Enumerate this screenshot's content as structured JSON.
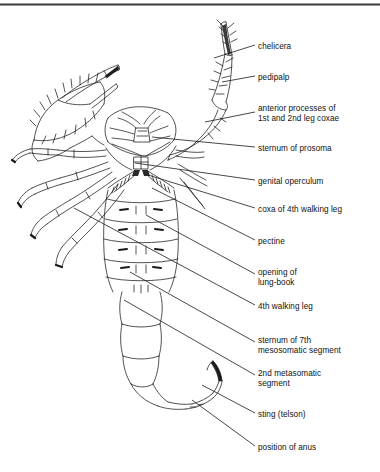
{
  "figure": {
    "background_color": "#ffffff",
    "ink_color": "#1a1a1a",
    "top_border_color": "#3a3a3a"
  },
  "labels": [
    {
      "id": "chelicera",
      "text": "chelicera",
      "x": 258,
      "y": 42,
      "leader": [
        255,
        45,
        214,
        58
      ]
    },
    {
      "id": "pedipalp",
      "text": "pedipalp",
      "x": 258,
      "y": 73,
      "leader": [
        255,
        76,
        222,
        82
      ]
    },
    {
      "id": "anterior-coxae-1",
      "text": "anterior processes of",
      "x": 258,
      "y": 104,
      "leader": [
        255,
        112,
        205,
        122
      ]
    },
    {
      "id": "anterior-coxae-2",
      "text": "1st and 2nd leg coxae",
      "x": 258,
      "y": 114,
      "leader": null
    },
    {
      "id": "sternum-prosoma",
      "text": "sternum of prosoma",
      "x": 258,
      "y": 144,
      "leader": [
        255,
        147,
        152,
        137
      ]
    },
    {
      "id": "genital-operculum",
      "text": "genital operculum",
      "x": 258,
      "y": 177,
      "leader": [
        255,
        180,
        135,
        163
      ]
    },
    {
      "id": "coxa-4th-leg",
      "text": "coxa of 4th walking leg",
      "x": 258,
      "y": 205,
      "leader": [
        255,
        208,
        148,
        175
      ]
    },
    {
      "id": "pectine",
      "text": "pectine",
      "x": 258,
      "y": 237,
      "leader": [
        255,
        240,
        152,
        188
      ]
    },
    {
      "id": "lung-book-1",
      "text": "opening of",
      "x": 258,
      "y": 268,
      "leader": [
        255,
        274,
        146,
        215
      ]
    },
    {
      "id": "lung-book-2",
      "text": "lung-book",
      "x": 258,
      "y": 278,
      "leader": null
    },
    {
      "id": "4th-walking-leg",
      "text": "4th walking leg",
      "x": 258,
      "y": 302,
      "leader": [
        255,
        305,
        74,
        208
      ]
    },
    {
      "id": "sternum-7th-1",
      "text": "sternum of 7th",
      "x": 258,
      "y": 336,
      "leader": [
        255,
        342,
        130,
        272
      ]
    },
    {
      "id": "sternum-7th-2",
      "text": "mesosomatic segment",
      "x": 258,
      "y": 346,
      "leader": null
    },
    {
      "id": "metasomatic-1",
      "text": "2nd metasomatic",
      "x": 258,
      "y": 369,
      "leader": [
        255,
        375,
        124,
        300
      ]
    },
    {
      "id": "metasomatic-2",
      "text": "segment",
      "x": 258,
      "y": 379,
      "leader": null
    },
    {
      "id": "sting-telson",
      "text": "sting (telson)",
      "x": 258,
      "y": 410,
      "leader": [
        255,
        413,
        202,
        385
      ]
    },
    {
      "id": "position-anus",
      "text": "position of anus",
      "x": 258,
      "y": 443,
      "leader": [
        255,
        446,
        192,
        400
      ]
    }
  ]
}
